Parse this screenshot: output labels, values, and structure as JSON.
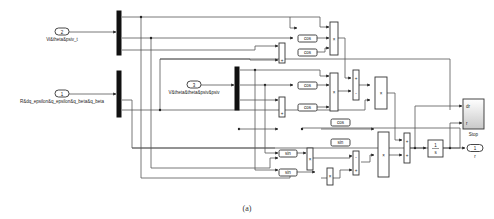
{
  "diagram": {
    "caption": "(a)",
    "inports": [
      {
        "number": "2",
        "label": "Vi&theta&psiv_t"
      },
      {
        "number": "1",
        "label": "R&dq_epsilon&q_epsilon&q_beta&q_beta"
      },
      {
        "number": "3",
        "label": "V&theta&theta&psiv&psiv"
      }
    ],
    "outport": {
      "number": "1",
      "label": "r"
    },
    "trig_blocks": {
      "cos1": "cos",
      "cos2": "cos",
      "cos3": "cos",
      "cos4": "cos",
      "cos5": "cos",
      "sin1": "sin",
      "sin2": "sin",
      "sin3": "sin"
    },
    "product_symbol": "×",
    "sum_signs": {
      "plus": "+",
      "minus": "-"
    },
    "divide_block": {
      "numerator": "1",
      "denominator": "s"
    },
    "scope": {
      "label": "Stop",
      "in1": "dr",
      "in2": "r"
    }
  }
}
